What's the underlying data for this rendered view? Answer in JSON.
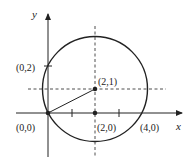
{
  "diagram": {
    "type": "circle-on-coordinate-plane",
    "axes": {
      "x_label": "x",
      "y_label": "y"
    },
    "circle": {
      "center": [
        2,
        1
      ],
      "radius_expr": "sqrt(5)",
      "passes_through": [
        [
          0,
          0
        ],
        [
          4,
          0
        ],
        [
          0,
          2
        ]
      ]
    },
    "points": [
      {
        "id": "origin",
        "label": "(0,0)",
        "x": 0,
        "y": 0
      },
      {
        "id": "y-intercept",
        "label": "(0,2)",
        "x": 0,
        "y": 2
      },
      {
        "id": "center",
        "label": "(2,1)",
        "x": 2,
        "y": 1
      },
      {
        "id": "foot",
        "label": "(2,0)",
        "x": 2,
        "y": 0
      },
      {
        "id": "x-intercept",
        "label": "(4,0)",
        "x": 4,
        "y": 0
      }
    ],
    "colors": {
      "stroke": "#222222",
      "background": "#ffffff"
    }
  }
}
